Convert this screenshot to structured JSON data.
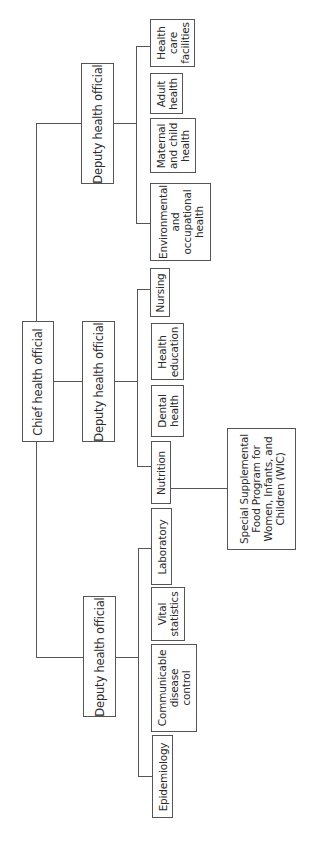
{
  "diagram": {
    "type": "org-chart",
    "orientation": "rotated-90-counterclockwise",
    "root": {
      "label": "Chief health official"
    },
    "deputies": [
      {
        "label": "Deputy health official",
        "units": [
          {
            "label": "Environmental\nand\noccupational\nhealth"
          },
          {
            "label": "Maternal\nand child\nhealth"
          },
          {
            "label": "Adult\nhealth"
          },
          {
            "label": "Health\ncare\nfacilities"
          }
        ]
      },
      {
        "label": "Deputy health official",
        "units": [
          {
            "label": "Nutrition"
          },
          {
            "label": "Dental\nhealth"
          },
          {
            "label": "Health\neducation"
          },
          {
            "label": "Nursing"
          }
        ],
        "sub_program": {
          "parent": "Nutrition",
          "label": "Special Supplemental\nFood Program for\nWomen, Infants, and\nChildren (WIC)"
        }
      },
      {
        "label": "Deputy health official",
        "units": [
          {
            "label": "Epidemiology"
          },
          {
            "label": "Communicable\ndisease\ncontrol"
          },
          {
            "label": "Vital\nstatistics"
          },
          {
            "label": "Laboratory"
          }
        ]
      }
    ]
  },
  "colors": {
    "line": "#555555",
    "text": "#2a2a2a",
    "background": "#ffffff"
  }
}
